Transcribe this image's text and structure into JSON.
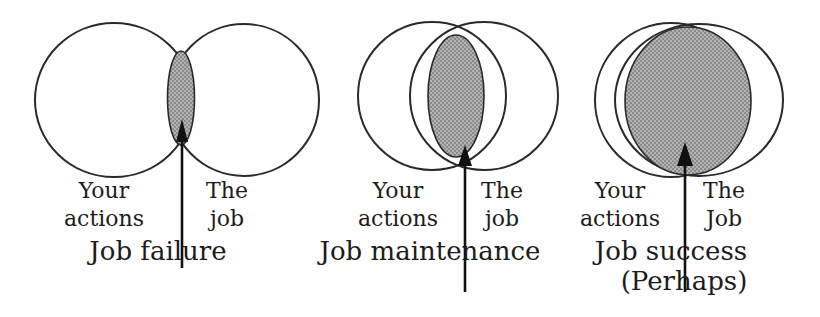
{
  "style": {
    "background": "#fefefe",
    "ink": "#1c1c1c",
    "circle_stroke": "#2a2a2a",
    "shade_base": "#b3b3b3",
    "shade_dot": "#8b8b8b",
    "arrow_color": "#111111"
  },
  "diagrams": [
    {
      "name": "job-failure",
      "left_label": [
        "Your",
        "actions"
      ],
      "right_label": [
        "The",
        "job"
      ],
      "caption": [
        "Job failure"
      ]
    },
    {
      "name": "job-maintenance",
      "left_label": [
        "Your",
        "actions"
      ],
      "right_label": [
        "The",
        "job"
      ],
      "caption": [
        "Job maintenance"
      ]
    },
    {
      "name": "job-success",
      "left_label": [
        "Your",
        "actions"
      ],
      "right_label": [
        "The",
        "Job"
      ],
      "caption": [
        "Job success",
        "(Perhaps)"
      ]
    }
  ]
}
